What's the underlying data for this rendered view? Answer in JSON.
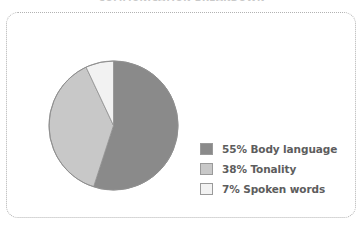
{
  "page": {
    "title_clipped": "COMMUNICATION BREAKDOWN",
    "background_color": "#ffffff",
    "border_color": "#b2b2b2",
    "border_style": "dotted-rounded"
  },
  "chart_data": {
    "type": "pie",
    "title": "COMMUNICATION BREAKDOWN",
    "xlabel": "",
    "ylabel": "",
    "legend_position": "right",
    "grid": false,
    "start_angle_deg": 0,
    "direction": "clockwise",
    "categories": [
      "Body language",
      "Tonality",
      "Spoken words"
    ],
    "values": [
      55,
      38,
      7
    ],
    "unit": "%",
    "colors": [
      "#8a8a8a",
      "#c8c8c8",
      "#f2f2f2"
    ],
    "slice_outline_color": "#8f8f8f",
    "slices": [
      {
        "label": "Body language",
        "value": 55,
        "legend_text": "55% Body language",
        "color": "#8a8a8a",
        "start_deg": 0,
        "end_deg": 198
      },
      {
        "label": "Tonality",
        "value": 38,
        "legend_text": "38% Tonality",
        "color": "#c8c8c8",
        "start_deg": 198,
        "end_deg": 334.8
      },
      {
        "label": "Spoken words",
        "value": 7,
        "legend_text": "7% Spoken words",
        "color": "#f2f2f2",
        "start_deg": 334.8,
        "end_deg": 360
      }
    ]
  },
  "legend": {
    "items": [
      {
        "text": "55% Body language",
        "color": "#8a8a8a"
      },
      {
        "text": "38% Tonality",
        "color": "#c8c8c8"
      },
      {
        "text": "7% Spoken words",
        "color": "#f2f2f2"
      }
    ]
  }
}
